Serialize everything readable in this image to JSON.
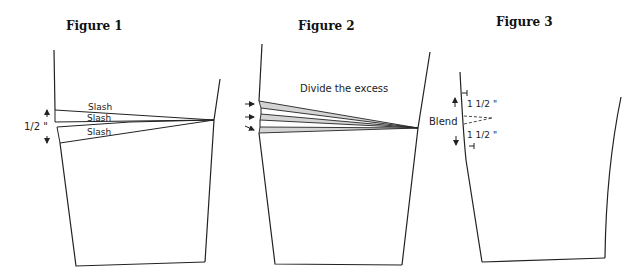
{
  "figures": [
    {
      "title": "Figure 1",
      "labels": {
        "slash_1": "Slash",
        "slash_2": "Slash",
        "slash_3": "Slash",
        "measurement": "1/2 \""
      }
    },
    {
      "title": "Figure 2",
      "labels": {
        "instruction": "Divide the excess"
      }
    },
    {
      "title": "Figure 3",
      "labels": {
        "blend": "Blend",
        "measure_top": "1 1/2 \"",
        "measure_bottom": "1 1/2 \""
      }
    }
  ]
}
